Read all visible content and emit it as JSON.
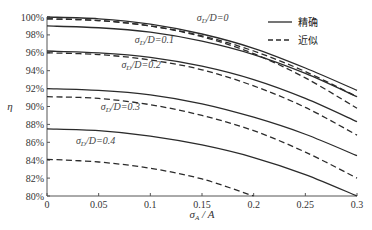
{
  "chart_data": {
    "type": "line",
    "title": "",
    "xlabel": "σA / A",
    "ylabel": "η",
    "xlim": [
      0,
      0.3
    ],
    "ylim": [
      80,
      100
    ],
    "x_ticks": [
      "0",
      "0.05",
      "0.1",
      "0.15",
      "0.2",
      "0.25",
      "0.3"
    ],
    "y_ticks": [
      "80%",
      "82%",
      "84%",
      "86%",
      "88%",
      "90%",
      "92%",
      "94%",
      "96%",
      "98%",
      "100%"
    ],
    "grid": false,
    "legend": {
      "position": "upper right",
      "entries": [
        {
          "label": "精确",
          "style": "solid"
        },
        {
          "label": "近似",
          "style": "dashed"
        }
      ]
    },
    "x": [
      0,
      0.05,
      0.1,
      0.15,
      0.2,
      0.25,
      0.3
    ],
    "series": [
      {
        "name": "σD/D=0 精确",
        "group": "0",
        "style": "solid",
        "values": [
          100.0,
          99.8,
          99.2,
          98.1,
          96.5,
          94.3,
          91.8
        ]
      },
      {
        "name": "σD/D=0 近似",
        "group": "0",
        "style": "dashed",
        "values": [
          99.8,
          99.6,
          99.0,
          97.9,
          96.2,
          93.9,
          91.1
        ]
      },
      {
        "name": "σD/D=0.1 精确",
        "group": "0.1",
        "style": "solid",
        "values": [
          99.0,
          98.8,
          98.3,
          97.3,
          95.8,
          93.7,
          91.1
        ]
      },
      {
        "name": "σD/D=0.1 近似",
        "group": "0.1",
        "style": "dashed",
        "values": [
          99.8,
          99.6,
          99.0,
          97.8,
          95.9,
          93.2,
          89.8
        ]
      },
      {
        "name": "σD/D=0.2 精确",
        "group": "0.2",
        "style": "solid",
        "values": [
          96.2,
          96.0,
          95.5,
          94.5,
          93.0,
          90.9,
          88.3
        ]
      },
      {
        "name": "σD/D=0.2 近似",
        "group": "0.2",
        "style": "dashed",
        "values": [
          96.0,
          95.8,
          95.2,
          94.1,
          92.3,
          89.9,
          86.8
        ]
      },
      {
        "name": "σD/D=0.3 精确",
        "group": "0.3",
        "style": "solid",
        "values": [
          92.0,
          91.8,
          91.3,
          90.3,
          88.8,
          86.9,
          84.5
        ]
      },
      {
        "name": "σD/D=0.3 近似",
        "group": "0.3",
        "style": "dashed",
        "values": [
          91.1,
          90.9,
          90.2,
          89.0,
          87.3,
          84.9,
          82.0
        ]
      },
      {
        "name": "σD/D=0.4 精确",
        "group": "0.4",
        "style": "solid",
        "values": [
          87.5,
          87.3,
          86.7,
          85.7,
          84.3,
          82.4,
          80.0
        ]
      },
      {
        "name": "σD/D=0.4 近似",
        "group": "0.4",
        "style": "dashed",
        "values": [
          84.1,
          83.8,
          83.1,
          81.9,
          80.0,
          null,
          null
        ]
      }
    ],
    "annotations": [
      {
        "text": "σD/D=0",
        "x": 0.145,
        "y": 99.6
      },
      {
        "text": "σD/D=0.1",
        "x": 0.085,
        "y": 97.1
      },
      {
        "text": "σD/D=0.2",
        "x": 0.072,
        "y": 94.3
      },
      {
        "text": "σD/D=0.3",
        "x": 0.052,
        "y": 89.6
      },
      {
        "text": "σD/D=0.4",
        "x": 0.028,
        "y": 85.8
      }
    ]
  },
  "layout": {
    "plot_left": 47,
    "plot_right": 357,
    "plot_top": 17,
    "plot_bottom": 196,
    "line_color": "#2b2b2b",
    "axis_color": "#555555"
  }
}
